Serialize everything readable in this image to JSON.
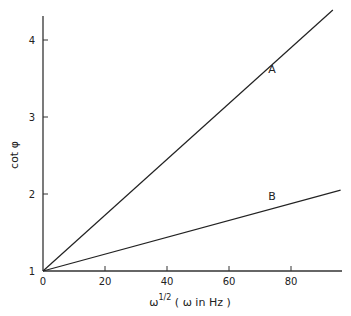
{
  "chart_data": {
    "type": "line",
    "title": "",
    "xlabel": "ω^1/2 (ω in Hz)",
    "xlabel_main": "ω",
    "xlabel_sup": "1/2",
    "xlabel_paren": "( ω in Hz )",
    "ylabel": "cot φ",
    "xlim": [
      0,
      96
    ],
    "ylim": [
      1,
      4.4
    ],
    "x_ticks": [
      0,
      20,
      40,
      60,
      80
    ],
    "y_ticks": [
      1,
      2,
      3,
      4
    ],
    "grid": false,
    "legend": "none (inline labels)",
    "series": [
      {
        "name": "A",
        "x": [
          0,
          93.5
        ],
        "y": [
          1,
          4.39
        ]
      },
      {
        "name": "B",
        "x": [
          0,
          96
        ],
        "y": [
          1,
          2.05
        ]
      }
    ]
  }
}
